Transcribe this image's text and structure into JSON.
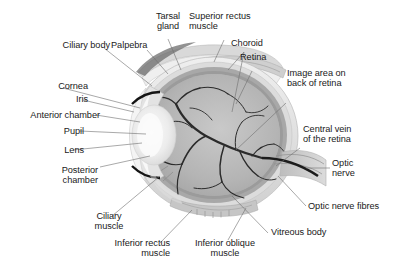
{
  "figure": {
    "type": "anatomical-diagram",
    "background_color": "#ffffff",
    "text_color": "#1a1a1a",
    "leader_line_color": "#6f6f6f",
    "palette": {
      "sclera_outer": "#e8e8e8",
      "sclera_mid": "#d2d2d2",
      "vitreous": "#b9b9b9",
      "choroid": "#9a9a9a",
      "retina_band": "#8a8a8a",
      "lens": "#f0f0f0",
      "cornea": "#f6f6f6",
      "vessel": "#2b2b2b",
      "muscle": "#c4c4c4",
      "optic_nerve": "#c9c9c9"
    }
  },
  "labels": [
    {
      "id": "ciliary-body",
      "text": "Ciliary body",
      "align": "right"
    },
    {
      "id": "palpebra",
      "text": "Palpebra",
      "align": "left"
    },
    {
      "id": "tarsal-gland",
      "text": "Tarsal\ngland",
      "align": "center"
    },
    {
      "id": "superior-rectus-muscle",
      "text": "Superior rectus\nmuscle",
      "align": "left"
    },
    {
      "id": "choroid",
      "text": "Choroid",
      "align": "left"
    },
    {
      "id": "retina",
      "text": "Retina",
      "align": "left"
    },
    {
      "id": "cornea",
      "text": "Cornea",
      "align": "right"
    },
    {
      "id": "iris",
      "text": "Iris",
      "align": "right"
    },
    {
      "id": "anterior-chamber",
      "text": "Anterior chamber",
      "align": "right"
    },
    {
      "id": "pupil",
      "text": "Pupil",
      "align": "right"
    },
    {
      "id": "lens",
      "text": "Lens",
      "align": "right"
    },
    {
      "id": "posterior-chamber",
      "text": "Posterior\nchamber",
      "align": "right"
    },
    {
      "id": "image-area-back-of-retina",
      "text": "Image area on\nback of retina",
      "align": "left"
    },
    {
      "id": "central-vein-of-the-retina",
      "text": "Central vein\nof the retina",
      "align": "left"
    },
    {
      "id": "optic-nerve",
      "text": "Optic\nnerve",
      "align": "left"
    },
    {
      "id": "optic-nerve-fibres",
      "text": "Optic nerve fibres",
      "align": "left"
    },
    {
      "id": "vitreous-body",
      "text": "Vitreous body",
      "align": "left"
    },
    {
      "id": "ciliary-muscle",
      "text": "Ciliary\nmuscle",
      "align": "center"
    },
    {
      "id": "inferior-rectus-muscle",
      "text": "Inferior rectus\nmuscle",
      "align": "right"
    },
    {
      "id": "inferior-oblique-muscle",
      "text": "Inferior oblique\nmuscle",
      "align": "center"
    }
  ]
}
